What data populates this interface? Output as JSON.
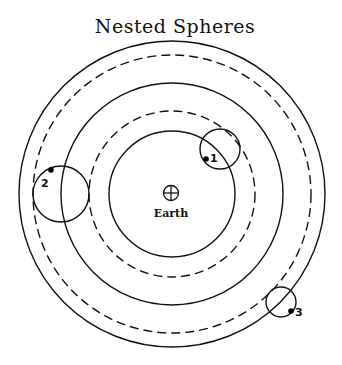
{
  "title": "Nested Spheres",
  "center": {
    "x": 172,
    "y": 194,
    "label": "Earth",
    "symbol": "earth-symbol"
  },
  "spheres": [
    {
      "id": "outer",
      "r": 153,
      "style": "solid"
    },
    {
      "id": "outer-dashed",
      "r": 139,
      "style": "dashed"
    },
    {
      "id": "middle",
      "r": 111,
      "style": "solid"
    },
    {
      "id": "middle-dashed",
      "r": 83,
      "style": "dashed"
    },
    {
      "id": "inner",
      "r": 63,
      "style": "solid"
    }
  ],
  "epicycles": [
    {
      "label": "1",
      "cx": 220,
      "cy": 149,
      "r": 20,
      "planet": {
        "x": 206,
        "y": 159
      },
      "label_pos": {
        "x": 211,
        "y": 161
      }
    },
    {
      "label": "2",
      "cx": 61,
      "cy": 194,
      "r": 28,
      "planet": {
        "x": 51,
        "y": 170
      },
      "label_pos": {
        "x": 41,
        "y": 187
      }
    },
    {
      "label": "3",
      "cx": 281,
      "cy": 302,
      "r": 15,
      "planet": {
        "x": 291,
        "y": 311
      },
      "label_pos": {
        "x": 295,
        "y": 316
      }
    }
  ],
  "colors": {
    "line": "#111111",
    "background": "#ffffff"
  }
}
